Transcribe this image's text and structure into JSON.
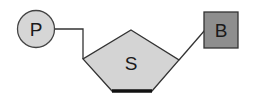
{
  "diagram": {
    "nodes": [
      {
        "id": "phosphate",
        "label": "P",
        "shape": "circle",
        "fill": "#d6d6d6"
      },
      {
        "id": "sugar",
        "label": "S",
        "shape": "pentagon",
        "fill": "#d4d4d4"
      },
      {
        "id": "base",
        "label": "B",
        "shape": "square",
        "fill": "#8e8e8e"
      }
    ],
    "edges": [
      {
        "from": "phosphate",
        "to": "sugar"
      },
      {
        "from": "sugar",
        "to": "base"
      }
    ]
  }
}
